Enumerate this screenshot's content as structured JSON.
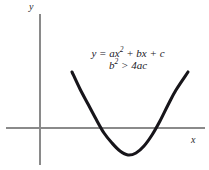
{
  "figure": {
    "background_color": "#ffffff",
    "axis_color": "#8a8a8a",
    "curve_color": "#17151a",
    "text_color": "#22201f",
    "axis_label_y": "y",
    "axis_label_x": "x",
    "equation_line_1_plain": "y = ax2 + bx + c",
    "equation_line_2_plain": "b2 > 4ac",
    "equation_line_1_parts": {
      "lhs": "y",
      "equals": " = ",
      "coef_a": "ax",
      "exponent_2": "2",
      "term_b": " + bx",
      "term_c": " + c"
    },
    "equation_line_2_parts": {
      "base_b": "b",
      "exponent_2": "2",
      "relation": " > ",
      "rhs": "4ac"
    }
  },
  "chart_data": {
    "type": "line",
    "title": "",
    "subtitle": "",
    "xlabel": "x",
    "ylabel": "y",
    "grid": false,
    "legend": null,
    "annotations": [
      {
        "name": "equation",
        "lines": [
          "y = ax² + bx + c",
          "b² > 4ac"
        ],
        "x_px": 128,
        "y_px": 60
      }
    ],
    "axes_px": {
      "origin_x": 40,
      "origin_y": 128,
      "x_axis_from_px": 6,
      "x_axis_to_px": 205,
      "y_axis_from_px": 14,
      "y_axis_to_px": 165
    },
    "series": [
      {
        "name": "parabola",
        "description": "upward opening quadratic with two distinct real roots",
        "vertex_px": [
          128,
          155
        ],
        "roots_px": [
          [
            98,
            128
          ],
          [
            158,
            128
          ]
        ],
        "endpoints_px": [
          [
            72,
            72
          ],
          [
            188,
            72
          ]
        ],
        "points_px": [
          [
            72,
            72
          ],
          [
            80,
            89
          ],
          [
            88,
            104
          ],
          [
            96,
            119
          ],
          [
            104,
            133
          ],
          [
            112,
            143
          ],
          [
            120,
            151
          ],
          [
            128,
            155
          ],
          [
            136,
            153
          ],
          [
            144,
            146
          ],
          [
            152,
            135
          ],
          [
            160,
            121
          ],
          [
            168,
            105
          ],
          [
            176,
            90
          ],
          [
            188,
            72
          ]
        ]
      }
    ]
  }
}
